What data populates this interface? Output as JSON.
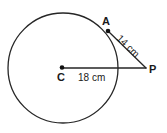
{
  "figure": {
    "background_color": "#ffffff",
    "stroke_color": "#262626",
    "text_color": "#1a1a1a",
    "circle": {
      "center_label": "C",
      "cx": 63,
      "cy": 68,
      "r": 55
    },
    "points": [
      {
        "label": "A",
        "x": 108,
        "y": 31,
        "role": "tangency-point"
      },
      {
        "label": "C",
        "x": 62,
        "y": 67,
        "role": "center"
      },
      {
        "label": "P",
        "x": 146,
        "y": 68,
        "role": "external-point"
      }
    ],
    "segments": [
      {
        "name": "C-P",
        "from": "C",
        "to": "P",
        "measure": "18 cm"
      },
      {
        "name": "A-P",
        "from": "A",
        "to": "P",
        "measure": "14 cm"
      }
    ],
    "labels": {
      "point_a": "A",
      "point_c": "C",
      "point_p": "P",
      "length_ap": "14 cm",
      "length_cp": "18 cm"
    }
  }
}
